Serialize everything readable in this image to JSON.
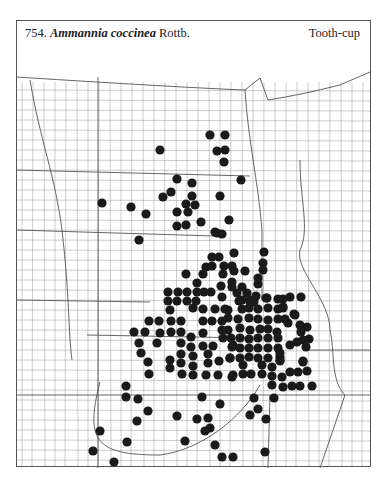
{
  "header": {
    "number": "754.",
    "species": "Ammannia coccinea",
    "author": "Rottb.",
    "common_name": "Tooth-cup"
  },
  "map": {
    "dot_color": "#1a1a1a",
    "dot_radius": 4.6,
    "line_color": "#777777",
    "dots": [
      [
        210,
        135
      ],
      [
        225,
        135
      ],
      [
        217,
        151
      ],
      [
        225,
        150
      ],
      [
        224,
        162
      ],
      [
        160,
        150
      ],
      [
        241,
        180
      ],
      [
        177,
        179
      ],
      [
        192,
        183
      ],
      [
        171,
        192
      ],
      [
        163,
        197
      ],
      [
        192,
        196
      ],
      [
        220,
        196
      ],
      [
        186,
        204
      ],
      [
        195,
        205
      ],
      [
        102,
        203
      ],
      [
        131,
        207
      ],
      [
        146,
        214
      ],
      [
        177,
        212
      ],
      [
        188,
        212
      ],
      [
        201,
        222
      ],
      [
        229,
        220
      ],
      [
        177,
        226
      ],
      [
        186,
        225
      ],
      [
        215,
        232
      ],
      [
        222,
        234
      ],
      [
        139,
        240
      ],
      [
        217,
        233
      ],
      [
        234,
        253
      ],
      [
        212,
        257
      ],
      [
        219,
        257
      ],
      [
        206,
        267
      ],
      [
        212,
        266
      ],
      [
        224,
        266
      ],
      [
        232,
        266
      ],
      [
        186,
        274
      ],
      [
        203,
        274
      ],
      [
        223,
        274
      ],
      [
        234,
        271
      ],
      [
        245,
        271
      ],
      [
        264,
        252
      ],
      [
        263,
        263
      ],
      [
        263,
        270
      ],
      [
        258,
        278
      ],
      [
        258,
        284
      ],
      [
        197,
        283
      ],
      [
        232,
        282
      ],
      [
        232,
        287
      ],
      [
        221,
        286
      ],
      [
        242,
        287
      ],
      [
        168,
        292
      ],
      [
        178,
        292
      ],
      [
        187,
        292
      ],
      [
        197,
        292
      ],
      [
        204,
        292
      ],
      [
        211,
        292
      ],
      [
        222,
        297
      ],
      [
        237,
        293
      ],
      [
        247,
        293
      ],
      [
        256,
        296
      ],
      [
        266,
        298
      ],
      [
        283,
        299
      ],
      [
        290,
        297
      ],
      [
        301,
        297
      ],
      [
        283,
        308
      ],
      [
        294,
        314
      ],
      [
        254,
        302
      ],
      [
        168,
        301
      ],
      [
        177,
        301
      ],
      [
        187,
        301
      ],
      [
        196,
        301
      ],
      [
        239,
        301
      ],
      [
        250,
        302
      ],
      [
        170,
        310
      ],
      [
        193,
        308
      ],
      [
        203,
        309
      ],
      [
        215,
        309
      ],
      [
        225,
        309
      ],
      [
        149,
        321
      ],
      [
        159,
        321
      ],
      [
        171,
        321
      ],
      [
        181,
        321
      ],
      [
        203,
        321
      ],
      [
        212,
        321
      ],
      [
        222,
        321
      ],
      [
        228,
        318
      ],
      [
        134,
        332
      ],
      [
        145,
        332
      ],
      [
        160,
        333
      ],
      [
        171,
        332
      ],
      [
        181,
        332
      ],
      [
        203,
        333
      ],
      [
        222,
        330
      ],
      [
        139,
        343
      ],
      [
        157,
        343
      ],
      [
        181,
        343
      ],
      [
        191,
        337
      ],
      [
        203,
        346
      ],
      [
        213,
        346
      ],
      [
        223,
        338
      ],
      [
        233,
        345
      ],
      [
        141,
        353
      ],
      [
        181,
        354
      ],
      [
        191,
        347
      ],
      [
        193,
        356
      ],
      [
        208,
        354
      ],
      [
        219,
        361
      ],
      [
        230,
        358
      ],
      [
        148,
        362
      ],
      [
        170,
        360
      ],
      [
        181,
        363
      ],
      [
        193,
        366
      ],
      [
        208,
        363
      ],
      [
        149,
        374
      ],
      [
        170,
        368
      ],
      [
        182,
        374
      ],
      [
        193,
        375
      ],
      [
        206,
        375
      ],
      [
        218,
        375
      ],
      [
        233,
        375
      ],
      [
        242,
        300
      ],
      [
        250,
        300
      ],
      [
        267,
        298
      ],
      [
        278,
        299
      ],
      [
        228,
        310
      ],
      [
        242,
        309
      ],
      [
        249,
        308
      ],
      [
        258,
        309
      ],
      [
        268,
        308
      ],
      [
        278,
        309
      ],
      [
        238,
        319
      ],
      [
        249,
        318
      ],
      [
        258,
        319
      ],
      [
        268,
        320
      ],
      [
        278,
        319
      ],
      [
        228,
        330
      ],
      [
        240,
        328
      ],
      [
        250,
        330
      ],
      [
        260,
        329
      ],
      [
        268,
        329
      ],
      [
        277,
        332
      ],
      [
        231,
        338
      ],
      [
        240,
        338
      ],
      [
        249,
        339
      ],
      [
        258,
        338
      ],
      [
        268,
        338
      ],
      [
        278,
        338
      ],
      [
        232,
        347
      ],
      [
        240,
        348
      ],
      [
        249,
        348
      ],
      [
        258,
        348
      ],
      [
        268,
        348
      ],
      [
        278,
        348
      ],
      [
        230,
        358
      ],
      [
        240,
        358
      ],
      [
        249,
        357
      ],
      [
        258,
        358
      ],
      [
        268,
        358
      ],
      [
        280,
        357
      ],
      [
        283,
        307
      ],
      [
        295,
        315
      ],
      [
        285,
        319
      ],
      [
        288,
        323
      ],
      [
        300,
        325
      ],
      [
        307,
        327
      ],
      [
        301,
        332
      ],
      [
        309,
        339
      ],
      [
        303,
        340
      ],
      [
        297,
        342
      ],
      [
        290,
        345
      ],
      [
        306,
        347
      ],
      [
        280,
        353
      ],
      [
        280,
        360
      ],
      [
        303,
        361
      ],
      [
        243,
        365
      ],
      [
        262,
        365
      ],
      [
        272,
        367
      ],
      [
        280,
        361
      ],
      [
        303,
        362
      ],
      [
        232,
        377
      ],
      [
        243,
        374
      ],
      [
        251,
        374
      ],
      [
        262,
        374
      ],
      [
        272,
        376
      ],
      [
        282,
        377
      ],
      [
        290,
        372
      ],
      [
        298,
        372
      ],
      [
        307,
        371
      ],
      [
        272,
        385
      ],
      [
        283,
        387
      ],
      [
        292,
        386
      ],
      [
        300,
        386
      ],
      [
        312,
        386
      ],
      [
        254,
        398
      ],
      [
        274,
        398
      ],
      [
        126,
        386
      ],
      [
        126,
        397
      ],
      [
        138,
        399
      ],
      [
        148,
        411
      ],
      [
        137,
        421
      ],
      [
        100,
        431
      ],
      [
        127,
        442
      ],
      [
        93,
        451
      ],
      [
        114,
        462
      ],
      [
        202,
        397
      ],
      [
        220,
        404
      ],
      [
        177,
        416
      ],
      [
        197,
        419
      ],
      [
        208,
        418
      ],
      [
        205,
        431
      ],
      [
        210,
        428
      ],
      [
        185,
        441
      ],
      [
        215,
        445
      ],
      [
        222,
        457
      ],
      [
        233,
        457
      ],
      [
        250,
        415
      ],
      [
        258,
        409
      ],
      [
        266,
        419
      ],
      [
        265,
        452
      ]
    ]
  }
}
